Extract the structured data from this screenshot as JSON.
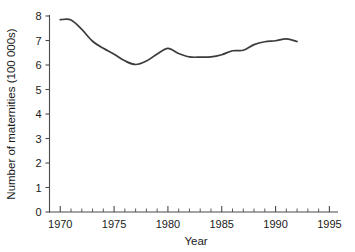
{
  "chart_data": {
    "type": "line",
    "title": "",
    "subtitle": "",
    "xlabel": "Year",
    "ylabel": "Number of maternities (100 000s)",
    "xlim": [
      1969,
      1995.8
    ],
    "ylim": [
      0,
      8
    ],
    "grid": false,
    "legend": null,
    "x_major_ticks": [
      1970,
      1975,
      1980,
      1985,
      1990,
      1995
    ],
    "x_major_tick_labels": [
      "1970",
      "1975",
      "1980",
      "1985",
      "1990",
      "1995"
    ],
    "x_minor_tick_step": 1,
    "y_ticks": [
      0,
      1,
      2,
      3,
      4,
      5,
      6,
      7,
      8
    ],
    "y_tick_labels": [
      "0",
      "1",
      "2",
      "3",
      "4",
      "5",
      "6",
      "7",
      "8"
    ],
    "series": [
      {
        "name": "Maternities",
        "color": "#3c3c3c",
        "x": [
          1970,
          1971,
          1972,
          1973,
          1974,
          1975,
          1976,
          1977,
          1978,
          1979,
          1980,
          1981,
          1982,
          1983,
          1984,
          1985,
          1986,
          1987,
          1988,
          1989,
          1990,
          1991,
          1992
        ],
        "values": [
          7.85,
          7.84,
          7.45,
          6.97,
          6.68,
          6.44,
          6.17,
          6.02,
          6.16,
          6.45,
          6.68,
          6.47,
          6.33,
          6.32,
          6.33,
          6.42,
          6.58,
          6.6,
          6.83,
          6.95,
          6.99,
          7.07,
          6.96
        ]
      }
    ]
  },
  "axis": {
    "y_title": "Number of maternities (100 000s)",
    "x_title": "Year"
  }
}
